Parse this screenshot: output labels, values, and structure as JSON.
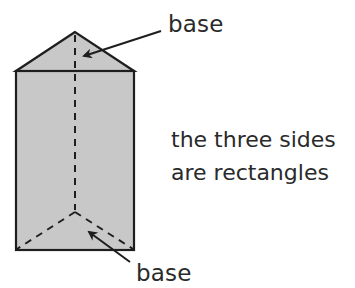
{
  "diagram": {
    "labels": {
      "top_base": "base",
      "bottom_base": "base"
    },
    "description": {
      "line1": "the three sides",
      "line2": "are rectangles"
    },
    "colors": {
      "face_fill": "#c8c8c8",
      "stroke": "#1e1e1e",
      "text": "#2a2a2a"
    }
  }
}
